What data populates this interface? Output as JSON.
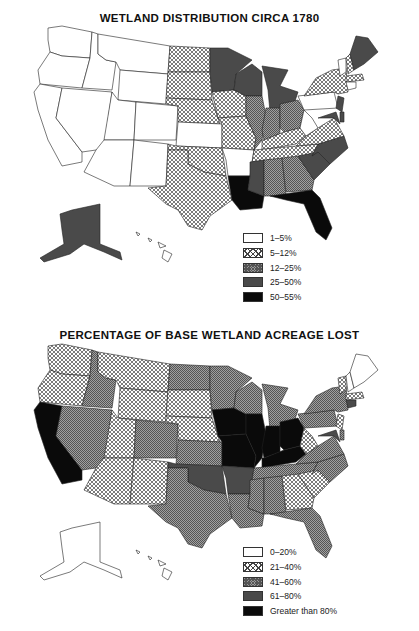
{
  "top_map": {
    "title": "WETLAND DISTRIBUTION CIRCA 1780",
    "legend": [
      {
        "label": "1–5%",
        "class": "white"
      },
      {
        "label": "5–12%",
        "class": "cross"
      },
      {
        "label": "12–25%",
        "class": "dot"
      },
      {
        "label": "25–50%",
        "class": "dark"
      },
      {
        "label": "50–55%",
        "class": "black"
      }
    ]
  },
  "bottom_map": {
    "title": "PERCENTAGE OF BASE WETLAND ACREAGE LOST",
    "legend": [
      {
        "label": "0–20%",
        "class": "white"
      },
      {
        "label": "21–40%",
        "class": "cross"
      },
      {
        "label": "41–60%",
        "class": "dot"
      },
      {
        "label": "61–80%",
        "class": "dark"
      },
      {
        "label": "Greater than 80%",
        "class": "black"
      }
    ]
  },
  "colors": {
    "white": "#ffffff",
    "cross_line": "#444444",
    "dot_fill": "#999999",
    "dark": "#4a4a4a",
    "black": "#0a0a0a"
  },
  "state_classes": {
    "top": {
      "WA": "white",
      "OR": "white",
      "CA": "white",
      "ID": "white",
      "NV": "white",
      "MT": "white",
      "WY": "white",
      "UT": "white",
      "CO": "white",
      "AZ": "white",
      "NM": "white",
      "ND": "cross",
      "SD": "cross",
      "NE": "cross",
      "KS": "white",
      "OK": "cross",
      "TX": "cross",
      "MN": "dark",
      "IA": "cross",
      "MO": "cross",
      "AR": "white",
      "LA": "black",
      "WI": "dark",
      "MI": "dark",
      "IL": "dot",
      "IN": "dot",
      "OH": "dot",
      "KY": "cross",
      "TN": "cross",
      "MS": "dark",
      "AL": "dot",
      "GA": "dot",
      "FL": "black",
      "SC": "dark",
      "NC": "dark",
      "VA": "cross",
      "WV": "white",
      "PA": "white",
      "NY": "cross",
      "VT": "white",
      "NH": "cross",
      "ME": "dark",
      "MA": "cross",
      "NJ": "dark",
      "MD": "dark",
      "DE": "dark",
      "AK": "dark",
      "HI": "white"
    },
    "bottom": {
      "WA": "cross",
      "OR": "cross",
      "CA": "black",
      "ID": "dot",
      "NV": "dot",
      "MT": "cross",
      "WY": "cross",
      "UT": "cross",
      "CO": "dot",
      "AZ": "cross",
      "NM": "cross",
      "ND": "dot",
      "SD": "cross",
      "NE": "cross",
      "KS": "dot",
      "OK": "dark",
      "TX": "dot",
      "MN": "dot",
      "IA": "black",
      "MO": "black",
      "AR": "dark",
      "LA": "dot",
      "WI": "dot",
      "MI": "dot",
      "IL": "black",
      "IN": "black",
      "OH": "black",
      "KY": "black",
      "TN": "dot",
      "MS": "dot",
      "AL": "dot",
      "GA": "cross",
      "FL": "dot",
      "SC": "cross",
      "NC": "dot",
      "VA": "dot",
      "WV": "cross",
      "PA": "dot",
      "NY": "dot",
      "VT": "cross",
      "NH": "white",
      "ME": "white",
      "MA": "cross",
      "CT": "dark",
      "NJ": "cross",
      "MD": "dark",
      "DE": "dot",
      "AK": "white",
      "HI": "white"
    }
  }
}
